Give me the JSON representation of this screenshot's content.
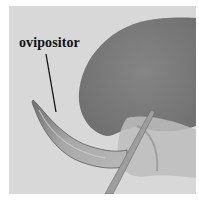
{
  "figure": {
    "annotation_label": "ovipositor",
    "colors": {
      "background": "#d8d8d8",
      "disc": "#7c7c7c",
      "ovipositor": "#9a9a9a",
      "leader_line": "#111111"
    }
  }
}
